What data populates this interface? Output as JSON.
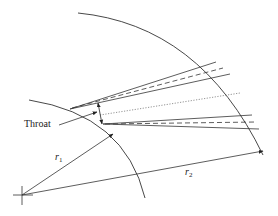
{
  "diagram": {
    "type": "vaned-diffuser-geometry",
    "labels": {
      "throat": "Throat",
      "r1": "r",
      "r1_sub": "1",
      "r2": "r",
      "r2_sub": "2"
    },
    "colors": {
      "line": "#333333",
      "dotted": "#666666",
      "background": "#ffffff"
    },
    "elements": [
      "inner-circle-arc",
      "outer-circle-arc",
      "center-cross",
      "r1-radius-arrow",
      "r2-radius-arrow",
      "upper-vane",
      "lower-vane",
      "passage-centerline",
      "throat-dimension-arrow",
      "throat-leader-line"
    ]
  }
}
